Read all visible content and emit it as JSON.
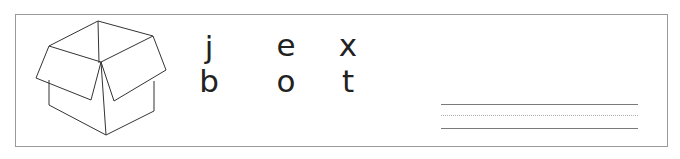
{
  "worksheet": {
    "illustration": {
      "name": "open-cardboard-box",
      "stroke_color": "#333333"
    },
    "letters": {
      "row1": [
        "j",
        "e",
        "x"
      ],
      "row2": [
        "b",
        "o",
        "t"
      ]
    },
    "writing_lines": {
      "count": 3,
      "style": [
        "solid",
        "dotted",
        "solid"
      ],
      "color": "#7a7a7a"
    },
    "border_color": "#9a9a9a"
  }
}
